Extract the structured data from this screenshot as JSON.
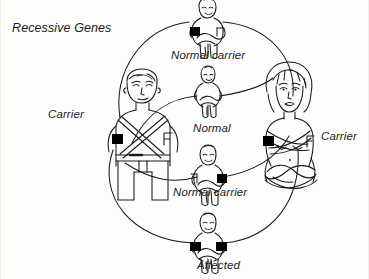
{
  "diagram": {
    "title": "Recessive Genes",
    "type": "genetics-inheritance-diagram",
    "background_color": "#fdfdfb",
    "ink_color": "#1a1a1a",
    "gene_marker_color": "#000000",
    "parents": [
      {
        "id": "father",
        "label": "Carrier",
        "sex": "male",
        "genotype": "carrier",
        "gene_markers": 1,
        "position": "left"
      },
      {
        "id": "mother",
        "label": "Carrier",
        "sex": "female",
        "genotype": "carrier",
        "gene_markers": 1,
        "position": "right"
      }
    ],
    "offspring": [
      {
        "id": "child-normal-carrier-top",
        "label": "Normal carrier",
        "gene_markers": 1,
        "marker_side": "left",
        "position": "top"
      },
      {
        "id": "child-normal",
        "label": "Normal",
        "gene_markers": 0,
        "marker_side": "none",
        "position": "upper-middle"
      },
      {
        "id": "child-normal-carrier-bottom",
        "label": "Normal carrier",
        "gene_markers": 1,
        "marker_side": "right",
        "position": "lower-middle"
      },
      {
        "id": "child-affected",
        "label": "Affected",
        "gene_markers": 2,
        "marker_side": "both",
        "position": "bottom"
      }
    ]
  }
}
